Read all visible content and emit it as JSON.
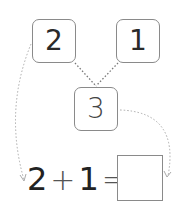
{
  "diagram": {
    "type": "number-bond",
    "parts": [
      {
        "label": "2"
      },
      {
        "label": "1"
      }
    ],
    "whole": {
      "label": "3"
    },
    "equation": {
      "left": "2",
      "operator": "+",
      "right": "1",
      "equals": "=",
      "answer": ""
    }
  },
  "colors": {
    "box_border": "#8a8a8a",
    "text": "#222222",
    "dotted_lines": "#aaaaaa"
  }
}
